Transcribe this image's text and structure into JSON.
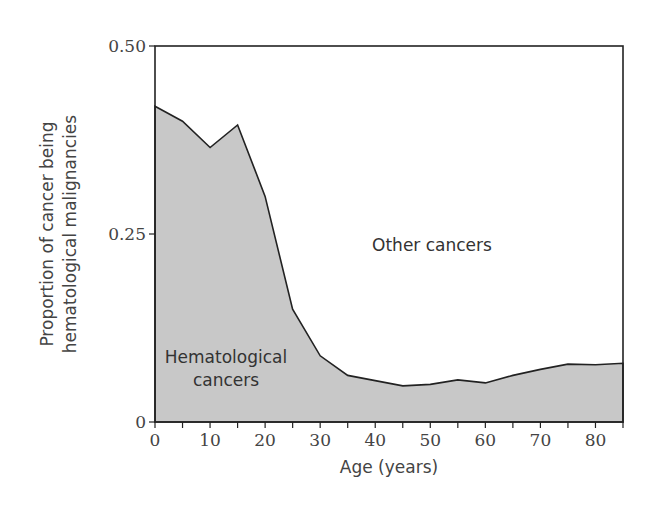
{
  "chart_data": {
    "type": "area",
    "title": "",
    "xlabel": "Age (years)",
    "ylabel": [
      "Proportion of cancer being",
      "hematological malignancies"
    ],
    "xlim": [
      0,
      85
    ],
    "ylim": [
      0,
      0.5
    ],
    "x_ticks": [
      0,
      10,
      20,
      30,
      40,
      50,
      60,
      70,
      80
    ],
    "x_minor_ticks": [
      5,
      15,
      25,
      35,
      45,
      55,
      65,
      75,
      85
    ],
    "y_ticks": [
      {
        "value": 0,
        "label": "0"
      },
      {
        "value": 0.25,
        "label": "0.25"
      },
      {
        "value": 0.5,
        "label": "0.50"
      }
    ],
    "grid": false,
    "x": [
      0,
      5,
      10,
      15,
      20,
      25,
      30,
      35,
      40,
      45,
      50,
      55,
      60,
      65,
      70,
      75,
      80,
      85
    ],
    "series": [
      {
        "name": "Hematological cancers",
        "values": [
          0.42,
          0.4,
          0.365,
          0.395,
          0.3,
          0.15,
          0.088,
          0.062,
          0.055,
          0.048,
          0.05,
          0.056,
          0.052,
          0.062,
          0.07,
          0.077,
          0.076,
          0.078
        ],
        "fill": "#c8c8c8"
      }
    ],
    "annotations": [
      {
        "text": "Other cancers",
        "x": 57,
        "y": 0.235
      },
      {
        "text": [
          "Hematological",
          "cancers"
        ],
        "x": 12,
        "y": 0.08
      }
    ]
  },
  "labels": {
    "other": "Other cancers",
    "hema_line1": "Hematological",
    "hema_line2": "cancers",
    "xlabel": "Age (years)",
    "ylabel_line1": "Proportion of cancer being",
    "ylabel_line2": "hematological malignancies"
  }
}
